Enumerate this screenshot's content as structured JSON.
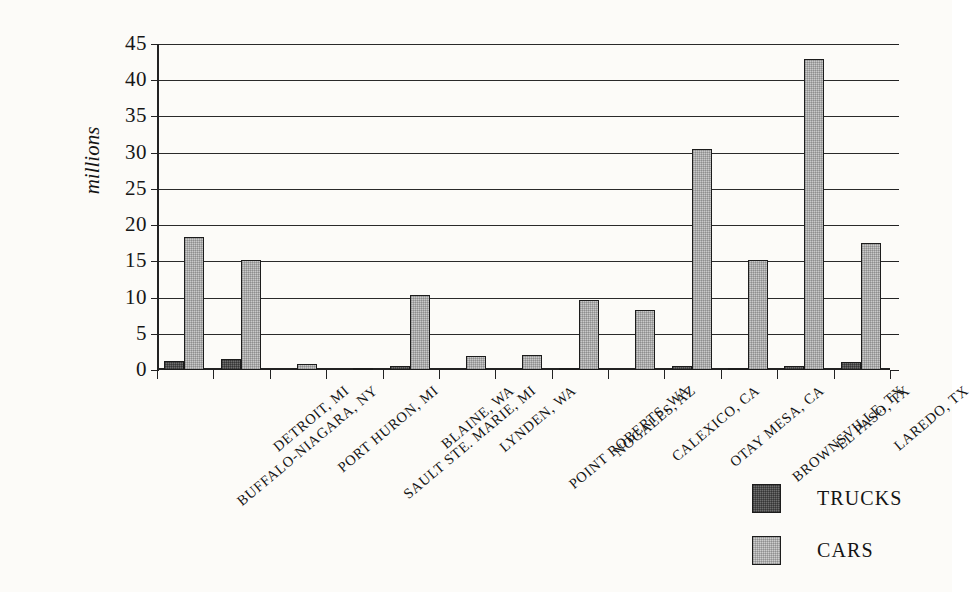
{
  "chart_data": {
    "type": "bar",
    "title": "",
    "xlabel": "",
    "ylabel": "millions",
    "ylim": [
      0,
      45
    ],
    "yticks": [
      0,
      5,
      10,
      15,
      20,
      25,
      30,
      35,
      40,
      45
    ],
    "ytick_labels": [
      "0",
      "5",
      "10",
      "15",
      "20",
      "25",
      "30",
      "35",
      "40",
      "45"
    ],
    "grid": true,
    "legend_position": "bottom-right",
    "categories": [
      "BUFFALO-NIAGARA, NY",
      "DETROIT, MI",
      "PORT HURON, MI",
      "SAULT STE. MARIE, MI",
      "BLAINE, WA",
      "LYNDEN, WA",
      "POINT ROBERTS, WA",
      "NOGALES, AZ",
      "CALEXICO, CA",
      "OTAY MESA, CA",
      "BROWNSVILLE, TX",
      "EL PASO, TX",
      "LAREDO, TX"
    ],
    "series": [
      {
        "name": "TRUCKS",
        "color": "#6f6f6f",
        "values": [
          1.2,
          1.5,
          0.0,
          0.0,
          0.5,
          0.0,
          0.0,
          0.3,
          0.0,
          0.5,
          0.2,
          0.5,
          1.1
        ]
      },
      {
        "name": "CARS",
        "color": "#c9c9c9",
        "values": [
          18.3,
          15.2,
          0.8,
          0.1,
          10.4,
          2.0,
          2.1,
          9.6,
          8.3,
          30.5,
          15.2,
          42.9,
          17.5
        ]
      }
    ]
  },
  "legend": {
    "items": [
      {
        "label": "TRUCKS",
        "swatch": "trucks-swatch"
      },
      {
        "label": "CARS",
        "swatch": "cars-swatch"
      }
    ]
  }
}
